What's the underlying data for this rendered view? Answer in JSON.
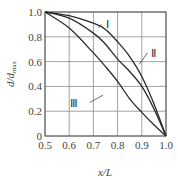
{
  "chart_data": {
    "type": "line",
    "title": "",
    "xlabel": "x/L",
    "ylabel": "d/d_max",
    "ylabel_main": "d/d",
    "ylabel_sub": "max",
    "xlim": [
      0.5,
      1.0
    ],
    "ylim": [
      0,
      1.0
    ],
    "grid": true,
    "x_ticks": [
      "0.5",
      "0.6",
      "0.7",
      "0.8",
      "0.9",
      "1.0"
    ],
    "y_ticks": [
      "0",
      "0.2",
      "0.4",
      "0.6",
      "0.8",
      "1.0"
    ],
    "series": [
      {
        "name": "Ⅰ",
        "x": [
          0.5,
          0.6,
          0.7,
          0.75,
          0.8,
          0.85,
          0.9,
          0.95,
          1.0
        ],
        "values": [
          1.0,
          0.97,
          0.91,
          0.86,
          0.76,
          0.64,
          0.48,
          0.26,
          0.0
        ],
        "label_pos": [
          0.75,
          0.9
        ],
        "leader_to": [
          0.72,
          0.87
        ]
      },
      {
        "name": "Ⅱ",
        "x": [
          0.5,
          0.6,
          0.7,
          0.75,
          0.8,
          0.85,
          0.9,
          0.95,
          1.0
        ],
        "values": [
          1.0,
          0.95,
          0.83,
          0.74,
          0.62,
          0.52,
          0.4,
          0.22,
          0.0
        ],
        "label_pos": [
          0.94,
          0.67
        ],
        "leader_to": [
          0.89,
          0.58
        ]
      },
      {
        "name": "Ⅲ",
        "x": [
          0.5,
          0.6,
          0.7,
          0.75,
          0.8,
          0.85,
          0.9,
          0.95,
          1.0
        ],
        "values": [
          1.0,
          0.87,
          0.67,
          0.56,
          0.44,
          0.3,
          0.19,
          0.09,
          0.0
        ],
        "label_pos": [
          0.66,
          0.27
        ],
        "leader_to": [
          0.74,
          0.33
        ]
      }
    ],
    "annotations": [
      "Ⅰ",
      "Ⅱ",
      "Ⅲ"
    ],
    "legend": "none (inline labels with leader lines)"
  }
}
